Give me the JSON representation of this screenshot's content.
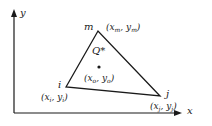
{
  "figure": {
    "type": "triangular-element-diagram",
    "colors": {
      "stroke": "#1a1a1a",
      "background": "#ffffff"
    },
    "axes": {
      "x_label": "x",
      "y_label": "y"
    },
    "vertices": [
      {
        "name": "i",
        "coord_x": "x",
        "coord_y": "y",
        "sub": "i"
      },
      {
        "name": "j",
        "coord_x": "x",
        "coord_y": "y",
        "sub": "j"
      },
      {
        "name": "m",
        "coord_x": "x",
        "coord_y": "y",
        "sub": "m"
      }
    ],
    "interior_point": {
      "name": "Q*",
      "coord_x": "x",
      "coord_y": "y",
      "sub": "o"
    }
  }
}
